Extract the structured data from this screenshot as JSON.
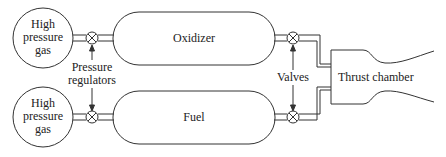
{
  "diagram": {
    "gas_tank_top": {
      "lines": [
        "High",
        "pressure",
        "gas"
      ]
    },
    "gas_tank_bottom": {
      "lines": [
        "High",
        "pressure",
        "gas"
      ]
    },
    "regulators_label": {
      "lines": [
        "Pressure",
        "regulators"
      ]
    },
    "oxidizer_label": "Oxidizer",
    "fuel_label": "Fuel",
    "valves_label": "Valves",
    "chamber_label": "Thrust chamber",
    "stroke_color": "#333333"
  }
}
